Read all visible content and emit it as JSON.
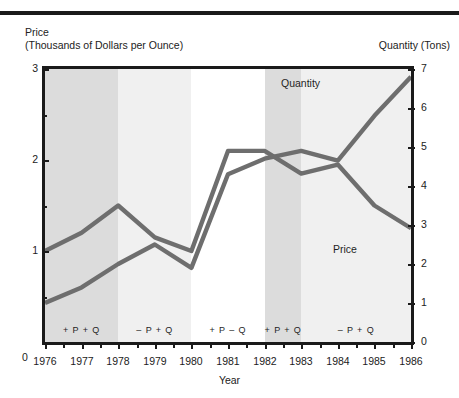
{
  "header": {
    "price_axis_title_line1": "Price",
    "price_axis_title_line2": "(Thousands of Dollars per Ounce)",
    "quantity_axis_title": "Quantity (Tons)"
  },
  "axes": {
    "x_axis_title": "Year",
    "left_zero_label": "0",
    "left_tick_labels": [
      "3",
      "2",
      "1"
    ],
    "right_tick_labels": [
      "7",
      "6",
      "5",
      "4",
      "3",
      "2",
      "1",
      "0"
    ],
    "x_tick_labels": [
      "1976",
      "1977",
      "1978",
      "1979",
      "1980",
      "1981",
      "1982",
      "1983",
      "1984",
      "1985",
      "1986"
    ]
  },
  "series_labels": {
    "quantity": "Quantity",
    "price": "Price"
  },
  "colors": {
    "line": "#6e6e6e",
    "frame": "#1a1a1a",
    "band_dark": "#dcdcdc",
    "band_light": "#f0f0f0",
    "background": "#ffffff",
    "text": "#222222"
  },
  "regimes": [
    {
      "label": "+ P + Q",
      "start": 1976,
      "end": 1978,
      "shade": "dark"
    },
    {
      "label": "– P + Q",
      "start": 1978,
      "end": 1980,
      "shade": "light"
    },
    {
      "label": "+ P – Q",
      "start": 1980,
      "end": 1982,
      "shade": "none"
    },
    {
      "label": "+ P + Q",
      "start": 1982,
      "end": 1983,
      "shade": "dark"
    },
    {
      "label": "– P + Q",
      "start": 1983,
      "end": 1986,
      "shade": "light"
    }
  ],
  "chart_data": {
    "type": "line",
    "title": "",
    "xlabel": "Year",
    "ylabel": "Price (Thousands of Dollars per Ounce)",
    "y2label": "Quantity (Tons)",
    "x": [
      1976,
      1977,
      1978,
      1979,
      1980,
      1981,
      1982,
      1983,
      1984,
      1985,
      1986
    ],
    "xlim": [
      1976,
      1986
    ],
    "ylim": [
      0,
      3
    ],
    "y2lim": [
      0,
      7
    ],
    "grid": false,
    "legend": "inline-annotations",
    "series": [
      {
        "name": "Price",
        "axis": "left",
        "units": "Thousands of Dollars per Ounce",
        "values": [
          1.0,
          1.2,
          1.5,
          1.15,
          1.0,
          2.1,
          2.1,
          1.85,
          1.95,
          1.5,
          1.25
        ]
      },
      {
        "name": "Quantity",
        "axis": "right",
        "units": "Tons",
        "values": [
          1.0,
          1.4,
          2.0,
          2.5,
          1.9,
          4.3,
          4.7,
          4.9,
          4.65,
          5.8,
          6.8
        ]
      }
    ],
    "annotations": [
      {
        "text": "+ P + Q",
        "x_start": 1976,
        "x_end": 1978
      },
      {
        "text": "– P + Q",
        "x_start": 1978,
        "x_end": 1980
      },
      {
        "text": "+ P – Q",
        "x_start": 1980,
        "x_end": 1982
      },
      {
        "text": "+ P + Q",
        "x_start": 1982,
        "x_end": 1983
      },
      {
        "text": "– P + Q",
        "x_start": 1983,
        "x_end": 1986
      }
    ]
  }
}
